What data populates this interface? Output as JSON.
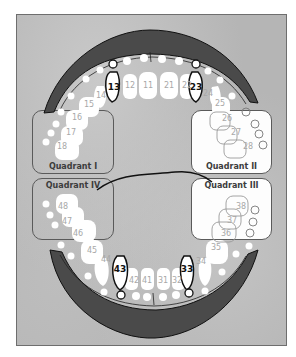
{
  "diagram": {
    "type": "dental-chart-fdi",
    "colors": {
      "background": "#b5b5b5",
      "gum": "#4a4a4a",
      "tooth": "#ffffff",
      "label": "#a8a8a8",
      "highlight_outline": "#111111"
    },
    "quadrants": [
      {
        "id": "I",
        "label": "Quadrant I",
        "position": "upper-left",
        "fill": "clear"
      },
      {
        "id": "II",
        "label": "Quadrant II",
        "position": "upper-right",
        "fill": "white"
      },
      {
        "id": "III",
        "label": "Quadrant III",
        "position": "lower-right",
        "fill": "white"
      },
      {
        "id": "IV",
        "label": "Quadrant IV",
        "position": "lower-left",
        "fill": "clear"
      }
    ],
    "upper_teeth": [
      "18",
      "17",
      "16",
      "15",
      "14",
      "13",
      "12",
      "11",
      "21",
      "22",
      "23",
      "24",
      "25",
      "26",
      "27",
      "28"
    ],
    "lower_teeth": [
      "48",
      "47",
      "46",
      "45",
      "44",
      "43",
      "42",
      "41",
      "31",
      "32",
      "33",
      "34",
      "35",
      "36",
      "37",
      "38"
    ],
    "highlighted_teeth": [
      "13",
      "23",
      "33",
      "43"
    ]
  },
  "labels": {
    "t11": "11",
    "t12": "12",
    "t13": "13",
    "t14": "14",
    "t15": "15",
    "t16": "16",
    "t17": "17",
    "t18": "18",
    "t21": "21",
    "t22": "22",
    "t23": "23",
    "t24": "24",
    "t25": "25",
    "t26": "26",
    "t27": "27",
    "t28": "28",
    "t31": "31",
    "t32": "32",
    "t33": "33",
    "t34": "34",
    "t35": "35",
    "t36": "36",
    "t37": "37",
    "t38": "38",
    "t41": "41",
    "t42": "42",
    "t43": "43",
    "t44": "44",
    "t45": "45",
    "t46": "46",
    "t47": "47",
    "t48": "48",
    "q1": "Quadrant I",
    "q2": "Quadrant II",
    "q3": "Quadrant III",
    "q4": "Quadrant IV"
  }
}
